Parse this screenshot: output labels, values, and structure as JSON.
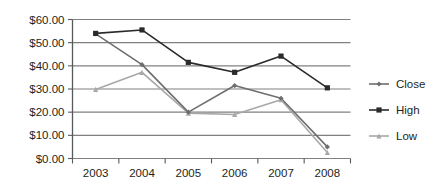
{
  "chart_data": {
    "type": "line",
    "title": "",
    "xlabel": "",
    "ylabel": "",
    "categories": [
      "2003",
      "2004",
      "2005",
      "2006",
      "2007",
      "2008"
    ],
    "series": [
      {
        "name": "Close",
        "values": [
          53.8,
          40.5,
          20.0,
          31.5,
          26.0,
          5.0
        ],
        "color": "#6e6e6e",
        "marker": "diamond"
      },
      {
        "name": "High",
        "values": [
          54.0,
          55.5,
          41.5,
          37.2,
          44.2,
          30.5
        ],
        "color": "#2a2a2a",
        "marker": "square"
      },
      {
        "name": "Low",
        "values": [
          29.8,
          37.2,
          19.6,
          19.0,
          25.4,
          2.6
        ],
        "color": "#a8a8a8",
        "marker": "triangle"
      }
    ],
    "ylim": [
      0,
      60
    ],
    "ytick_values": [
      60,
      50,
      40,
      30,
      20,
      10,
      0
    ],
    "ytick_labels": [
      "$60.00",
      "$50.00",
      "$40.00",
      "$30.00",
      "$20.00",
      "$10.00",
      "$0.00"
    ],
    "xtick_labels": [
      "2003",
      "2004",
      "2005",
      "2006",
      "2007",
      "2008"
    ],
    "grid": "horizontal",
    "grid_color": "#808080",
    "axis_color": "#58595b",
    "legend": {
      "position": "right",
      "entries": [
        {
          "label": "Close",
          "color": "#6e6e6e",
          "marker": "diamond"
        },
        {
          "label": "High",
          "color": "#2a2a2a",
          "marker": "square"
        },
        {
          "label": "Low",
          "color": "#a8a8a8",
          "marker": "triangle"
        }
      ]
    }
  },
  "legend": {
    "items": [
      {
        "label": "Close"
      },
      {
        "label": "High"
      },
      {
        "label": "Low"
      }
    ]
  },
  "axes": {
    "y_labels": [
      "$60.00",
      "$50.00",
      "$40.00",
      "$30.00",
      "$20.00",
      "$10.00",
      "$0.00"
    ],
    "x_labels": [
      "2003",
      "2004",
      "2005",
      "2006",
      "2007",
      "2008"
    ]
  }
}
